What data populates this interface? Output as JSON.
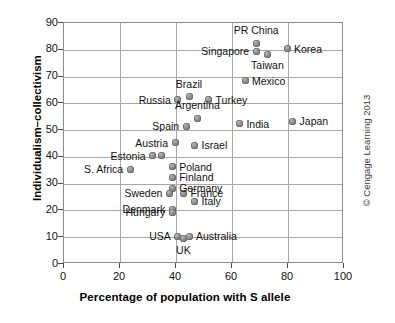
{
  "chart_data": {
    "type": "scatter",
    "title": "",
    "xlabel": "Percentage of population with S allele",
    "ylabel": "Individualism–collectivism",
    "xlim": [
      0,
      100
    ],
    "ylim": [
      0,
      90
    ],
    "xticks": [
      0,
      20,
      40,
      60,
      80,
      100
    ],
    "yticks": [
      0,
      10,
      20,
      30,
      40,
      50,
      60,
      70,
      80,
      90
    ],
    "grid": true,
    "legend": null,
    "points": [
      {
        "label": "PR China",
        "x": 69,
        "y": 82,
        "label_pos": "above"
      },
      {
        "label": "Singapore",
        "x": 69,
        "y": 79,
        "label_pos": "left"
      },
      {
        "label": "Korea",
        "x": 80,
        "y": 80,
        "label_pos": "right"
      },
      {
        "label": "Taiwan",
        "x": 73,
        "y": 78,
        "label_pos": "below"
      },
      {
        "label": "Mexico",
        "x": 65,
        "y": 68,
        "label_pos": "right"
      },
      {
        "label": "Brazil",
        "x": 45,
        "y": 62,
        "label_pos": "above"
      },
      {
        "label": "Russia",
        "x": 41,
        "y": 61,
        "label_pos": "left"
      },
      {
        "label": "Turkey",
        "x": 52,
        "y": 61,
        "label_pos": "right"
      },
      {
        "label": "Argentina",
        "x": 48,
        "y": 54,
        "label_pos": "above"
      },
      {
        "label": "Spain",
        "x": 44,
        "y": 51,
        "label_pos": "left"
      },
      {
        "label": "India",
        "x": 63,
        "y": 52,
        "label_pos": "right"
      },
      {
        "label": "Japan",
        "x": 82,
        "y": 53,
        "label_pos": "right"
      },
      {
        "label": "Austria",
        "x": 40,
        "y": 45,
        "label_pos": "left"
      },
      {
        "label": "Israel",
        "x": 47,
        "y": 44,
        "label_pos": "right"
      },
      {
        "label": "Estonia",
        "x": 32,
        "y": 40,
        "label_pos": "left"
      },
      {
        "label": "",
        "x": 35,
        "y": 40,
        "label_pos": "none"
      },
      {
        "label": "S. Africa",
        "x": 24,
        "y": 35,
        "label_pos": "left"
      },
      {
        "label": "Poland",
        "x": 39,
        "y": 36,
        "label_pos": "right"
      },
      {
        "label": "Finland",
        "x": 39,
        "y": 32,
        "label_pos": "right"
      },
      {
        "label": "Germany",
        "x": 39,
        "y": 28,
        "label_pos": "right"
      },
      {
        "label": "Sweden",
        "x": 38,
        "y": 26,
        "label_pos": "left"
      },
      {
        "label": "France",
        "x": 43,
        "y": 26,
        "label_pos": "right"
      },
      {
        "label": "Italy",
        "x": 47,
        "y": 23,
        "label_pos": "right"
      },
      {
        "label": "Denmark",
        "x": 39,
        "y": 20,
        "label_pos": "left"
      },
      {
        "label": "Hungary",
        "x": 39,
        "y": 19,
        "label_pos": "left"
      },
      {
        "label": "USA",
        "x": 41,
        "y": 10,
        "label_pos": "left"
      },
      {
        "label": "UK",
        "x": 43,
        "y": 9,
        "label_pos": "below"
      },
      {
        "label": "Australia",
        "x": 45,
        "y": 10,
        "label_pos": "right"
      }
    ]
  },
  "credit": {
    "text": "© Cengage Learning 2013"
  },
  "colors": {
    "point_fill": "#8d8d8d",
    "grid": "#a8a8a8",
    "frame": "#8c8c8c",
    "text": "#111111"
  }
}
